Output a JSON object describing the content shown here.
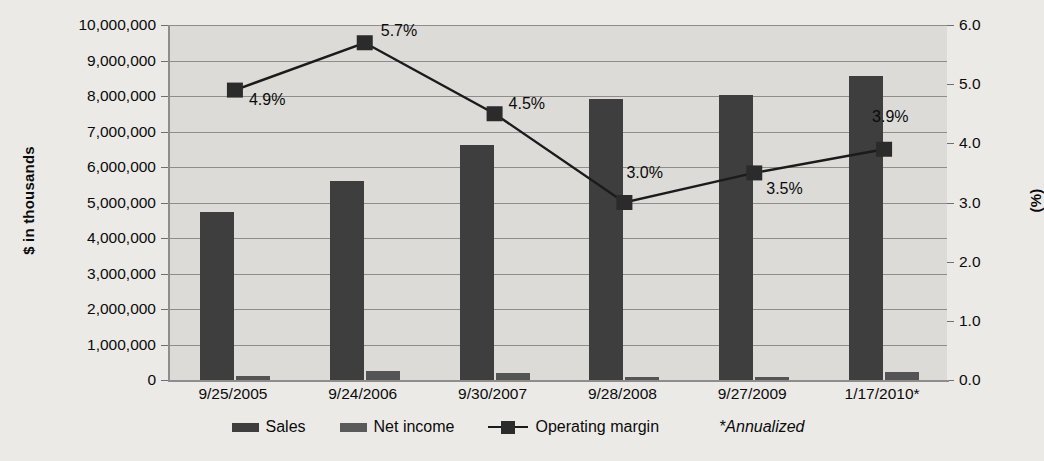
{
  "chart_data": {
    "type": "bar",
    "title": "",
    "xlabel": "",
    "ylabel": "$ in thousands",
    "y2label": "(%)",
    "categories": [
      "9/25/2005",
      "9/24/2006",
      "9/30/2007",
      "9/28/2008",
      "9/27/2009",
      "1/17/2010*"
    ],
    "ylim": [
      0,
      10000000
    ],
    "y2lim": [
      0,
      6.0
    ],
    "grid": true,
    "legend_position": "bottom",
    "series": [
      {
        "name": "Sales",
        "type": "bar",
        "axis": "left",
        "color": "#3e3e3e",
        "values": [
          4730000,
          5600000,
          6620000,
          7920000,
          8020000,
          8550000
        ]
      },
      {
        "name": "Net income",
        "type": "bar",
        "axis": "left",
        "color": "#545454",
        "values": [
          120000,
          250000,
          190000,
          80000,
          75000,
          220000
        ]
      },
      {
        "name": "Operating margin",
        "type": "line",
        "axis": "right",
        "color": "#1b1b1b",
        "marker": "square",
        "values": [
          4.9,
          5.7,
          4.5,
          3.0,
          3.5,
          3.9
        ],
        "data_labels": [
          "4.9%",
          "5.7%",
          "4.5%",
          "3.0%",
          "3.5%",
          "3.9%"
        ]
      }
    ],
    "yticks": [
      "0",
      "1,000,000",
      "2,000,000",
      "3,000,000",
      "4,000,000",
      "5,000,000",
      "6,000,000",
      "7,000,000",
      "8,000,000",
      "9,000,000",
      "10,000,000"
    ],
    "y2ticks": [
      "0.0",
      "1.0",
      "2.0",
      "3.0",
      "4.0",
      "5.0",
      "6.0"
    ],
    "annotations": [
      "*Annualized"
    ]
  },
  "axes": {
    "left_title": "$ in thousands",
    "right_title": "(%)"
  },
  "legend": {
    "items": [
      {
        "label": "Sales",
        "kind": "bar-swatch"
      },
      {
        "label": "Net income",
        "kind": "bar-swatch"
      },
      {
        "label": "Operating margin",
        "kind": "line-marker"
      }
    ],
    "footnote": "*Annualized"
  },
  "colors": {
    "background": "#eceae7",
    "plot_fill": "#dddbd8",
    "gridline": "#8e8d8a",
    "sales_bar": "#3e3e3e",
    "net_income_bar": "#545454",
    "margin_line": "#1b1b1b",
    "text": "#0b0b0b"
  }
}
